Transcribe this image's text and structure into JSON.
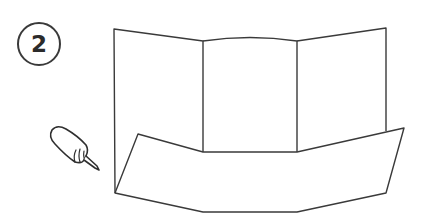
{
  "step": {
    "number": "2"
  },
  "illustration": {
    "subject": "tri-fold board with folded-up bottom pocket strip",
    "tool_icon": "glue-bottle-icon",
    "line_color": "#3a3a3a",
    "background": "#ffffff"
  }
}
